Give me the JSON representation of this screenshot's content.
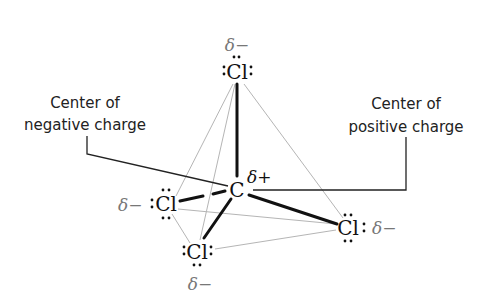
{
  "diagram": {
    "central_atom": {
      "symbol": "C",
      "charge": "δ+"
    },
    "atoms": [
      {
        "id": "top",
        "symbol": "Cl",
        "charge": "δ−"
      },
      {
        "id": "left",
        "symbol": "Cl",
        "charge": "δ−"
      },
      {
        "id": "bottom",
        "symbol": "Cl",
        "charge": "δ−"
      },
      {
        "id": "right",
        "symbol": "Cl",
        "charge": "δ−"
      }
    ],
    "labels": {
      "negative_line1": "Center of",
      "negative_line2": "negative charge",
      "positive_line1": "Center of",
      "positive_line2": "positive charge"
    },
    "colors": {
      "bond": "#111111",
      "tetrahedron_edge": "#b5b5b5",
      "partial_negative": "#777777"
    }
  }
}
